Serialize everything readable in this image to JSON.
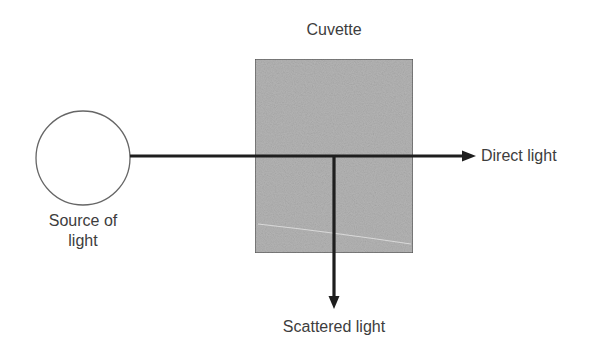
{
  "diagram": {
    "type": "schematic",
    "labels": {
      "cuvette": "Cuvette",
      "source": "Source of light",
      "direct": "Direct light",
      "scattered": "Scattered light"
    },
    "colors": {
      "background": "#ffffff",
      "cuvette_fill": "#b4b4b4",
      "cuvette_border": "#555555",
      "line": "#1e1e1e",
      "circle_stroke": "#666666",
      "text": "#3d3d3d"
    },
    "elements": [
      {
        "id": "light-source",
        "shape": "circle",
        "label": "Source of light"
      },
      {
        "id": "cuvette",
        "shape": "rectangle",
        "label": "Cuvette"
      },
      {
        "id": "direct-beam",
        "shape": "arrow",
        "direction": "right",
        "label": "Direct light"
      },
      {
        "id": "scattered-beam",
        "shape": "arrow",
        "direction": "down",
        "label": "Scattered light"
      }
    ]
  }
}
